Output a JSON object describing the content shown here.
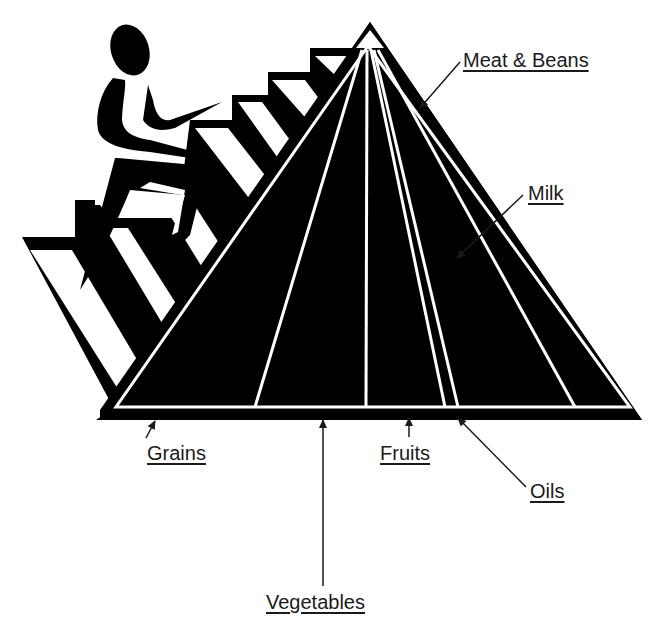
{
  "diagram": {
    "type": "food-pyramid",
    "colors": {
      "background": "#ffffff",
      "ink": "#000000",
      "stripe": "#ffffff",
      "label_text": "#1a1a1a"
    },
    "labels": {
      "meat_beans": "Meat & Beans",
      "milk": "Milk",
      "grains": "Grains",
      "fruits": "Fruits",
      "oils": "Oils",
      "vegetables": "Vegetables"
    },
    "figure": "person-climbing-stairs-icon",
    "segments_left_to_right": [
      "Grains",
      "Vegetables",
      "Fruits",
      "Oils",
      "Milk",
      "Meat & Beans"
    ]
  }
}
